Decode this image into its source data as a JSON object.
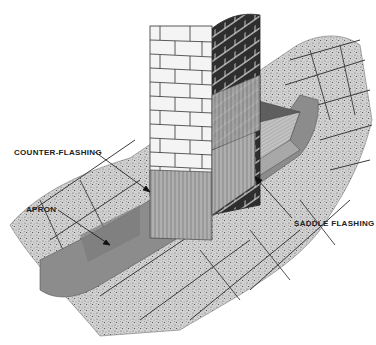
{
  "diagram": {
    "style": "grayscale technical illustration",
    "labels": {
      "counter_flashing": "COUNTER-FLASHING",
      "apron": "APRON",
      "saddle_flashing": "SADDLE FLASHING"
    },
    "colors": {
      "background": "#ffffff",
      "shingle": "#c8c8c8",
      "flashing": "#8a8a8a",
      "saddle": "#b8b8b8",
      "brick_face": "#f4f4f4",
      "brick_side": "#3a3a3a",
      "mortar_line": "#333333"
    }
  }
}
